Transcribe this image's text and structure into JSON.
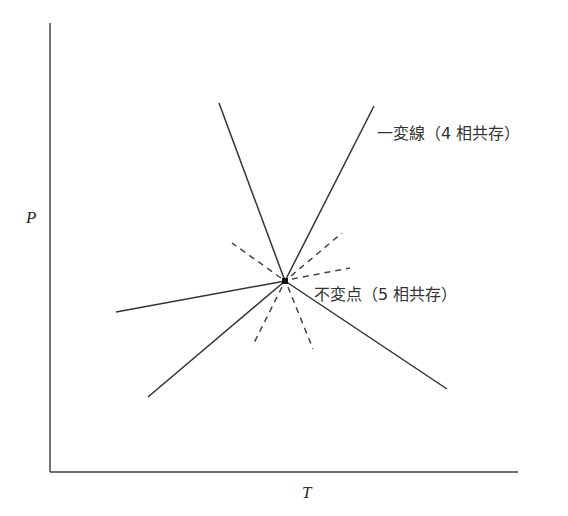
{
  "chart_data": {
    "type": "diagram",
    "title": "",
    "xlabel": "T",
    "ylabel": "P",
    "grid": false,
    "axes": {
      "origin": [
        51,
        472
      ],
      "x_end": [
        518,
        472
      ],
      "y_end": [
        50,
        23
      ]
    },
    "invariant_point": {
      "x": 285,
      "y": 281,
      "label": "不変点（5 相共存）"
    },
    "univariant_lines": [
      {
        "id": "upper-left",
        "from": [
          285,
          281
        ],
        "to": [
          219,
          103
        ],
        "style": "solid"
      },
      {
        "id": "upper-right",
        "from": [
          285,
          281
        ],
        "to": [
          374,
          106
        ],
        "style": "solid",
        "label": "一変線（4 相共存）"
      },
      {
        "id": "left",
        "from": [
          285,
          281
        ],
        "to": [
          116,
          312
        ],
        "style": "solid"
      },
      {
        "id": "lower-left",
        "from": [
          285,
          281
        ],
        "to": [
          148,
          397
        ],
        "style": "solid"
      },
      {
        "id": "lower-right",
        "from": [
          285,
          281
        ],
        "to": [
          447,
          389
        ],
        "style": "solid"
      }
    ],
    "metastable_extensions": [
      {
        "id": "ext-upper-left",
        "from": [
          281,
          278
        ],
        "to": [
          232,
          243
        ],
        "style": "dashed"
      },
      {
        "id": "ext-upper-right",
        "from": [
          291,
          276
        ],
        "to": [
          342,
          233
        ],
        "style": "dashed"
      },
      {
        "id": "ext-right",
        "from": [
          292,
          279
        ],
        "to": [
          350,
          268
        ],
        "style": "dashed"
      },
      {
        "id": "ext-lower-left",
        "from": [
          282,
          287
        ],
        "to": [
          253,
          345
        ],
        "style": "dashed"
      },
      {
        "id": "ext-lower-right",
        "from": [
          288,
          287
        ],
        "to": [
          313,
          349
        ],
        "style": "dashed"
      }
    ],
    "annotations": [
      {
        "text": "一変線（4 相共存）",
        "x": 377,
        "y": 139
      },
      {
        "text": "不変点（5 相共存）",
        "x": 314,
        "y": 300
      }
    ]
  },
  "labels": {
    "x_axis": "T",
    "y_axis": "P",
    "univariant_line": "一変線（4 相共存）",
    "invariant_point": "不変点（5 相共存）"
  }
}
